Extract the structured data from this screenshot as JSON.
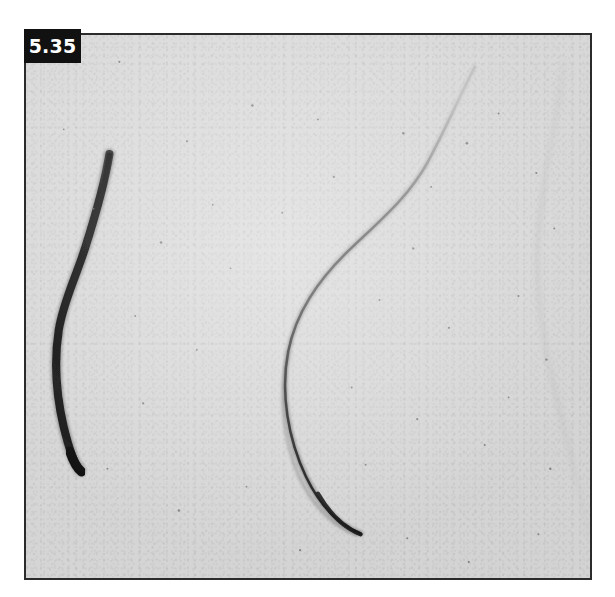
{
  "figure": {
    "label": "5.35",
    "label_bg_color": "#111111",
    "label_text_color": "#ffffff",
    "border_color": "#2b2b2b",
    "background_color": "#dddedd",
    "page_background": "#ffffff",
    "plate": {
      "x": 24,
      "y": 33,
      "width": 568,
      "height": 547
    }
  },
  "specimens": [
    {
      "name": "left-dark-fiber",
      "description": "thick opaque dark fiber, gentle S-curve",
      "color": "#121212",
      "max_stroke_width": 8.5,
      "tip_top": [
        108,
        152
      ],
      "tip_bottom": [
        78,
        473
      ],
      "path": "M108,153 C104,178 96,208 84,246 C74,278 62,300 57,330 C52,362 55,398 62,428 C68,452 72,464 79,472"
    },
    {
      "name": "center-fiber-primary",
      "description": "long slender fiber, sigmoid curve, pale at the top and progressively darker toward the lower tip",
      "color_top": "#b4b4b4",
      "color_bottom": "#1b1b1b",
      "max_stroke_width": 3.4,
      "tip_top": [
        476,
        64
      ],
      "tip_bottom": [
        362,
        536
      ],
      "path": "M476,65 C460,96 446,129 428,162 C408,198 378,222 346,253 C318,281 296,312 288,352 C280,394 288,440 306,478 C322,511 342,528 361,535"
    },
    {
      "name": "center-fiber-secondary",
      "description": "faint companion strand diverging from the primary fiber in the lower bend",
      "color": "#9a9a9a",
      "max_stroke_width": 2.0,
      "path": "M289,352 C279,392 284,440 301,479 C317,512 339,529 358,536"
    },
    {
      "name": "right-faint-fiber",
      "description": "extremely pale fiber along the right edge, broad shallow C-curve",
      "color": "#c6c6c6",
      "max_stroke_width": 2.4,
      "path": "M566,58 C560,118 544,170 540,236 C536,300 548,360 562,414 C574,462 584,502 590,536"
    }
  ],
  "specks": [
    {
      "x": 118,
      "y": 60,
      "r": 1.1
    },
    {
      "x": 186,
      "y": 140,
      "r": 1.0
    },
    {
      "x": 252,
      "y": 104,
      "r": 1.2
    },
    {
      "x": 160,
      "y": 242,
      "r": 1.3
    },
    {
      "x": 212,
      "y": 204,
      "r": 0.9
    },
    {
      "x": 318,
      "y": 118,
      "r": 1.0
    },
    {
      "x": 334,
      "y": 176,
      "r": 1.1
    },
    {
      "x": 404,
      "y": 132,
      "r": 1.2
    },
    {
      "x": 432,
      "y": 186,
      "r": 1.0
    },
    {
      "x": 468,
      "y": 142,
      "r": 1.3
    },
    {
      "x": 500,
      "y": 112,
      "r": 1.0
    },
    {
      "x": 538,
      "y": 172,
      "r": 1.1
    },
    {
      "x": 556,
      "y": 228,
      "r": 1.0
    },
    {
      "x": 414,
      "y": 248,
      "r": 1.2
    },
    {
      "x": 380,
      "y": 300,
      "r": 1.0
    },
    {
      "x": 450,
      "y": 328,
      "r": 1.1
    },
    {
      "x": 520,
      "y": 296,
      "r": 1.0
    },
    {
      "x": 548,
      "y": 360,
      "r": 1.2
    },
    {
      "x": 352,
      "y": 388,
      "r": 1.0
    },
    {
      "x": 418,
      "y": 420,
      "r": 1.1
    },
    {
      "x": 486,
      "y": 446,
      "r": 1.0
    },
    {
      "x": 552,
      "y": 470,
      "r": 1.2
    },
    {
      "x": 196,
      "y": 350,
      "r": 1.0
    },
    {
      "x": 142,
      "y": 404,
      "r": 1.1
    },
    {
      "x": 106,
      "y": 470,
      "r": 1.0
    },
    {
      "x": 178,
      "y": 512,
      "r": 1.2
    },
    {
      "x": 246,
      "y": 488,
      "r": 0.9
    },
    {
      "x": 300,
      "y": 552,
      "r": 1.1
    },
    {
      "x": 408,
      "y": 540,
      "r": 1.0
    },
    {
      "x": 470,
      "y": 564,
      "r": 1.1
    },
    {
      "x": 540,
      "y": 536,
      "r": 1.0
    },
    {
      "x": 92,
      "y": 208,
      "r": 1.0
    },
    {
      "x": 62,
      "y": 128,
      "r": 0.9
    },
    {
      "x": 134,
      "y": 316,
      "r": 1.0
    },
    {
      "x": 230,
      "y": 268,
      "r": 0.9
    },
    {
      "x": 282,
      "y": 212,
      "r": 1.0
    },
    {
      "x": 366,
      "y": 466,
      "r": 1.0
    },
    {
      "x": 510,
      "y": 398,
      "r": 0.9
    }
  ]
}
